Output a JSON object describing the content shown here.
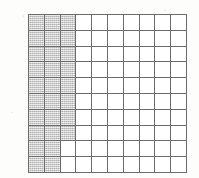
{
  "figure": {
    "name": "shaded-grid",
    "type": "square-grid-fraction-model",
    "rows": 10,
    "columns": 10,
    "total_cells": 100,
    "shaded_cells": 28,
    "unshaded_cells": 72,
    "colors": {
      "grid_line": "#6b6b6b",
      "shaded_fill": "#c9c9c9",
      "unshaded_fill": "#ffffff",
      "page_background": "#fdfdfc"
    },
    "shading_description": "Left-hand columns shaded: rows 1-8 shade columns 1-3; rows 9-10 shade columns 1-2.",
    "shaded_map": [
      [
        1,
        1,
        1,
        0,
        0,
        0,
        0,
        0,
        0,
        0
      ],
      [
        1,
        1,
        1,
        0,
        0,
        0,
        0,
        0,
        0,
        0
      ],
      [
        1,
        1,
        1,
        0,
        0,
        0,
        0,
        0,
        0,
        0
      ],
      [
        1,
        1,
        1,
        0,
        0,
        0,
        0,
        0,
        0,
        0
      ],
      [
        1,
        1,
        1,
        0,
        0,
        0,
        0,
        0,
        0,
        0
      ],
      [
        1,
        1,
        1,
        0,
        0,
        0,
        0,
        0,
        0,
        0
      ],
      [
        1,
        1,
        1,
        0,
        0,
        0,
        0,
        0,
        0,
        0
      ],
      [
        1,
        1,
        1,
        0,
        0,
        0,
        0,
        0,
        0,
        0
      ],
      [
        1,
        1,
        0,
        0,
        0,
        0,
        0,
        0,
        0,
        0
      ],
      [
        1,
        1,
        0,
        0,
        0,
        0,
        0,
        0,
        0,
        0
      ]
    ]
  },
  "chart_data": {
    "type": "heatmap",
    "title": "",
    "xlabel": "",
    "ylabel": "",
    "categories": [
      "1",
      "2",
      "3",
      "4",
      "5",
      "6",
      "7",
      "8",
      "9",
      "10"
    ],
    "row_labels": [
      "1",
      "2",
      "3",
      "4",
      "5",
      "6",
      "7",
      "8",
      "9",
      "10"
    ],
    "grid": true,
    "legend": "none",
    "values": [
      [
        1,
        1,
        1,
        0,
        0,
        0,
        0,
        0,
        0,
        0
      ],
      [
        1,
        1,
        1,
        0,
        0,
        0,
        0,
        0,
        0,
        0
      ],
      [
        1,
        1,
        1,
        0,
        0,
        0,
        0,
        0,
        0,
        0
      ],
      [
        1,
        1,
        1,
        0,
        0,
        0,
        0,
        0,
        0,
        0
      ],
      [
        1,
        1,
        1,
        0,
        0,
        0,
        0,
        0,
        0,
        0
      ],
      [
        1,
        1,
        1,
        0,
        0,
        0,
        0,
        0,
        0,
        0
      ],
      [
        1,
        1,
        1,
        0,
        0,
        0,
        0,
        0,
        0,
        0
      ],
      [
        1,
        1,
        1,
        0,
        0,
        0,
        0,
        0,
        0,
        0
      ],
      [
        1,
        1,
        0,
        0,
        0,
        0,
        0,
        0,
        0,
        0
      ],
      [
        1,
        1,
        0,
        0,
        0,
        0,
        0,
        0,
        0,
        0
      ]
    ]
  }
}
